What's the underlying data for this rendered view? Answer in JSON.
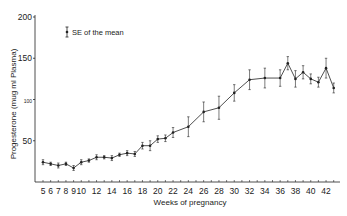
{
  "chart_data": {
    "type": "line",
    "title": "",
    "xlabel": "Weeks of pregnancy",
    "ylabel": "Progesterone (mug ml Plasma)",
    "ylim": [
      0,
      200
    ],
    "yticks": [
      50,
      100,
      150,
      200
    ],
    "ytick_labels": [
      "50",
      "100",
      "150",
      "200"
    ],
    "xlim": [
      4.5,
      43.5
    ],
    "xtick_labels": [
      "5",
      "6",
      "7",
      "8",
      "9",
      "10",
      "12",
      "14",
      "16",
      "18",
      "20",
      "22",
      "24",
      "26",
      "28",
      "30",
      "32",
      "34",
      "36",
      "38",
      "40",
      "42"
    ],
    "xtick_values": [
      5,
      6,
      7,
      8,
      9,
      10,
      12,
      14,
      16,
      18,
      20,
      22,
      24,
      26,
      28,
      30,
      32,
      34,
      36,
      38,
      40,
      42
    ],
    "grid": false,
    "legend": {
      "position": "upper-left",
      "entries": [
        "SE of the mean"
      ]
    },
    "series": [
      {
        "name": "Mean progesterone",
        "x": [
          5,
          6,
          7,
          8,
          9,
          10,
          11,
          12,
          13,
          14,
          15,
          16,
          17,
          18,
          19,
          20,
          21,
          22,
          24,
          26,
          28,
          30,
          32,
          34,
          36,
          37,
          38,
          39,
          40,
          41,
          42,
          43
        ],
        "values": [
          24,
          22,
          20,
          22,
          17,
          24,
          26,
          30,
          30,
          29,
          33,
          35,
          34,
          44,
          44,
          52,
          53,
          60,
          67,
          85,
          90,
          108,
          124,
          126,
          126,
          144,
          125,
          133,
          125,
          121,
          138,
          114
        ],
        "se": [
          3,
          2,
          3,
          2,
          3,
          3,
          2,
          3,
          2,
          3,
          2,
          3,
          3,
          4,
          6,
          4,
          4,
          6,
          12,
          12,
          14,
          10,
          12,
          12,
          10,
          8,
          10,
          8,
          6,
          6,
          12,
          6
        ]
      }
    ]
  },
  "legend": {
    "label": "SE of the mean"
  },
  "axes": {
    "xlabel": "Weeks of pregnancy",
    "ylabel": "Progesterone (mug ml Plasma)"
  }
}
